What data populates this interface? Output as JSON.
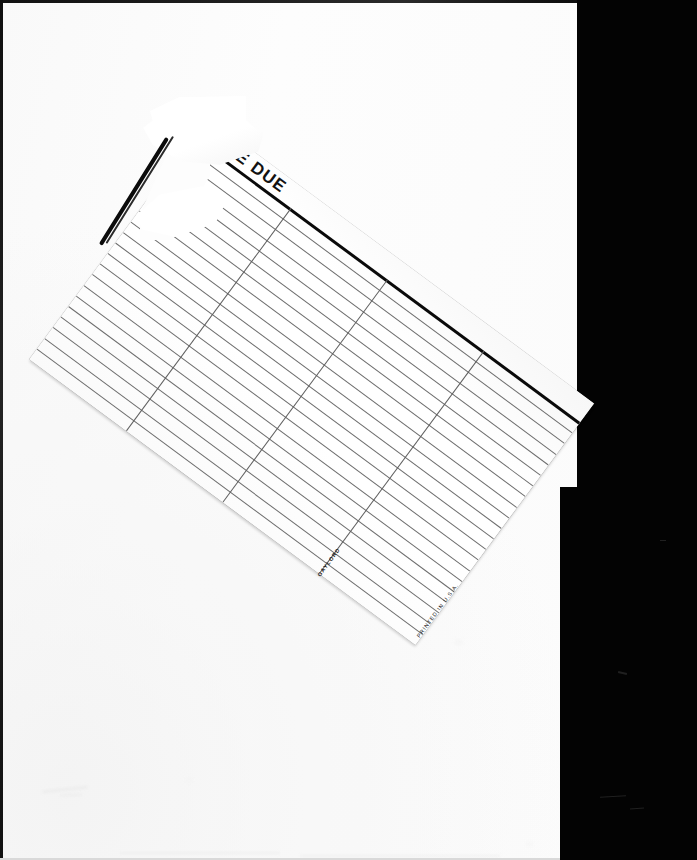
{
  "scan": {
    "description": "Scanned blank page with a rotated library Date Due slip laid on top",
    "background_color": "#030303",
    "page_color": "#fdfdfd",
    "page_edge_color": "#111111",
    "width": 697,
    "height": 860
  },
  "slip": {
    "title": "DATE DUE",
    "title_visible_fragment": "DA",
    "rotation_degrees": 36.5,
    "ink_color": "#1c1c1c",
    "rule_color": "#6d6d6d",
    "columns": 4,
    "rows": 21,
    "imprints": {
      "printed_in": "PRINTED IN U.S.A.",
      "brand": "GAYLORD"
    },
    "cells": [
      [
        "",
        "",
        "",
        ""
      ],
      [
        "",
        "",
        "",
        ""
      ],
      [
        "",
        "",
        "",
        ""
      ],
      [
        "",
        "",
        "",
        ""
      ],
      [
        "",
        "",
        "",
        ""
      ],
      [
        "",
        "",
        "",
        ""
      ],
      [
        "",
        "",
        "",
        ""
      ],
      [
        "",
        "",
        "",
        ""
      ],
      [
        "",
        "",
        "",
        ""
      ],
      [
        "",
        "",
        "",
        ""
      ],
      [
        "",
        "",
        "",
        ""
      ],
      [
        "",
        "",
        "",
        ""
      ],
      [
        "",
        "",
        "",
        ""
      ],
      [
        "",
        "",
        "",
        ""
      ],
      [
        "",
        "",
        "",
        ""
      ],
      [
        "",
        "",
        "",
        ""
      ],
      [
        "",
        "",
        "",
        ""
      ],
      [
        "",
        "",
        "",
        ""
      ],
      [
        "",
        "",
        "",
        ""
      ],
      [
        "",
        "",
        "",
        ""
      ],
      [
        "",
        "",
        "",
        ""
      ]
    ]
  },
  "artifacts": {
    "torn_flap_label": "torn-paper-flap",
    "tear_shadow_label": "torn-edge-shadow"
  }
}
